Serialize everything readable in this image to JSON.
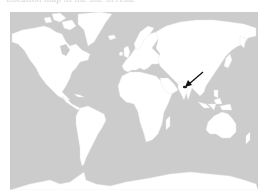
{
  "caption": {
    "text": "Location map of the site in Asia"
  },
  "map": {
    "projection": "equirectangular world",
    "ocean_color": "#cccccc",
    "land_color": "#ffffff",
    "border_color": "#e4e4e4",
    "marker": {
      "type": "arrow",
      "color": "#111111",
      "from": [
        203,
        72
      ],
      "to": [
        186,
        86
      ],
      "description": "arrow pointing to location in southern China / northern Myanmar"
    }
  }
}
